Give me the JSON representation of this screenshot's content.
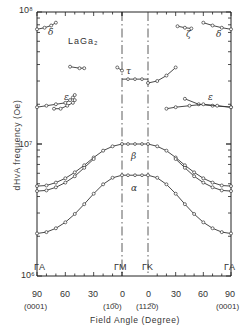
{
  "chart_data": {
    "type": "scatter",
    "xlabel": "Field Angle (Degree)",
    "ylabel": "dHvA frequency (Oe)",
    "yscale": "log",
    "ylim": [
      1000000,
      100000000
    ],
    "y_ticks": [
      "10^6",
      "10^7",
      "10^8"
    ],
    "x_segments": [
      {
        "from": "ΓA",
        "to": "ΓM",
        "from_deg": 90,
        "to_deg": 0,
        "from_dir": "(0001)",
        "to_dir": "(10-10)"
      },
      {
        "from": "ΓK",
        "to": "ΓA",
        "from_deg": 0,
        "to_deg": 90,
        "from_dir": "(11-20)",
        "to_dir": "(0001)"
      }
    ],
    "x_tick_labels": [
      "90",
      "60",
      "30",
      "0",
      "0",
      "30",
      "60",
      "90"
    ],
    "direction_labels": [
      "(0001)",
      "(10̅0)",
      "(112̅0)",
      "(0001)"
    ],
    "symmetry_labels": [
      "ΓA",
      "ΓM",
      "ΓK",
      "ΓA"
    ],
    "grid": false,
    "legend": "none",
    "series": [
      {
        "name": "α",
        "points": [
          [
            -90,
            2100000.0
          ],
          [
            -80,
            2150000.0
          ],
          [
            -70,
            2300000.0
          ],
          [
            -60,
            2550000.0
          ],
          [
            -50,
            2950000.0
          ],
          [
            -40,
            3500000.0
          ],
          [
            -30,
            4200000.0
          ],
          [
            -20,
            4950000.0
          ],
          [
            -10,
            5550000.0
          ],
          [
            0,
            5800000.0
          ],
          [
            0,
            5800000.0
          ],
          [
            10,
            5550000.0
          ],
          [
            20,
            4950000.0
          ],
          [
            30,
            4200000.0
          ],
          [
            40,
            3500000.0
          ],
          [
            50,
            2950000.0
          ],
          [
            60,
            2550000.0
          ],
          [
            70,
            2300000.0
          ],
          [
            80,
            2150000.0
          ],
          [
            90,
            2100000.0
          ]
        ],
        "flat_between_M_K": 5800000.0
      },
      {
        "name": "β",
        "points": [
          [
            -90,
            4800000.0
          ],
          [
            -80,
            4850000.0
          ],
          [
            -70,
            5100000.0
          ],
          [
            -60,
            5500000.0
          ],
          [
            -50,
            6100000.0
          ],
          [
            -40,
            6900000.0
          ],
          [
            -30,
            7900000.0
          ],
          [
            -20,
            8900000.0
          ],
          [
            -10,
            9600000.0
          ],
          [
            0,
            10000000.0
          ],
          [
            0,
            10000000.0
          ],
          [
            10,
            9600000.0
          ],
          [
            20,
            8900000.0
          ],
          [
            30,
            7900000.0
          ],
          [
            40,
            6900000.0
          ],
          [
            50,
            6100000.0
          ],
          [
            60,
            5500000.0
          ],
          [
            70,
            5100000.0
          ],
          [
            80,
            4850000.0
          ],
          [
            90,
            4800000.0
          ]
        ],
        "flat_between_M_K": 10000000.0
      },
      {
        "name": "β'",
        "points": [
          [
            -90,
            4400000.0
          ],
          [
            -80,
            4450000.0
          ],
          [
            -70,
            4700000.0
          ],
          [
            -60,
            5100000.0
          ],
          [
            -50,
            5700000.0
          ],
          [
            -40,
            6600000.0
          ],
          [
            -30,
            7700000.0
          ],
          [
            30,
            7700000.0
          ],
          [
            40,
            6600000.0
          ],
          [
            50,
            5700000.0
          ],
          [
            60,
            5100000.0
          ],
          [
            70,
            4700000.0
          ],
          [
            80,
            4450000.0
          ],
          [
            90,
            4400000.0
          ]
        ]
      },
      {
        "name": "τ",
        "points": [
          [
            -5,
            38000000.0
          ],
          [
            0,
            36000000.0
          ],
          [
            0,
            29000000.0
          ],
          [
            10,
            30000000.0
          ],
          [
            20,
            33000000.0
          ],
          [
            30,
            38000000.0
          ]
        ],
        "flat_between_M_K": 31000000.0
      },
      {
        "name": "τ (isolated)",
        "points": [
          [
            -55,
            38500000.0
          ],
          [
            -45,
            37500000.0
          ],
          [
            -40,
            37500000.0
          ]
        ]
      },
      {
        "name": "δ",
        "points": [
          [
            -90,
            74000000.0
          ],
          [
            -82,
            76000000.0
          ],
          [
            -75,
            79000000.0
          ],
          [
            -70,
            83000000.0
          ],
          [
            60,
            83000000.0
          ],
          [
            70,
            79000000.0
          ],
          [
            80,
            76000000.0
          ],
          [
            90,
            74000000.0
          ]
        ]
      },
      {
        "name": "ζ",
        "points": [
          [
            32,
            78000000.0
          ],
          [
            40,
            76000000.0
          ],
          [
            47,
            75000000.0
          ]
        ]
      },
      {
        "name": "ε",
        "points": [
          [
            -90,
            19000000.0
          ],
          [
            -80,
            19500000.0
          ],
          [
            -70,
            20000000.0
          ],
          [
            -60,
            20500000.0
          ],
          [
            -55,
            21500000.0
          ],
          [
            -52,
            22500000.0
          ],
          [
            -50,
            23500000.0
          ],
          [
            40,
            22000000.0
          ],
          [
            55,
            20000000.0
          ],
          [
            70,
            19500000.0
          ],
          [
            90,
            19000000.0
          ]
        ]
      },
      {
        "name": "ε'",
        "points": [
          [
            -72,
            18500000.0
          ],
          [
            -65,
            18500000.0
          ],
          [
            -58,
            19500000.0
          ],
          [
            -52,
            20500000.0
          ],
          [
            -50,
            21500000.0
          ],
          [
            20,
            18500000.0
          ],
          [
            30,
            19000000.0
          ],
          [
            45,
            19500000.0
          ],
          [
            60,
            20000000.0
          ],
          [
            75,
            19500000.0
          ],
          [
            90,
            19000000.0
          ]
        ]
      }
    ],
    "annotations": [
      "LaGa2",
      "α",
      "β",
      "τ",
      "δ",
      "ζ",
      "ε",
      "ε",
      "δ"
    ]
  },
  "labels": {
    "compound": "LaGa₂",
    "y_title": "dHvA frequency (Oe)",
    "x_title": "Field Angle (Degree)",
    "y_tick_top": "10⁸",
    "y_tick_mid": "10⁷",
    "y_tick_bot": "10⁶",
    "sym_GA_left": "ΓA",
    "sym_GM": "ΓM",
    "sym_GK": "ΓK",
    "sym_GA_right": "ΓA",
    "x90l": "90",
    "x60l": "60",
    "x30l": "30",
    "x0m": "0",
    "x0k": "0",
    "x30r": "30",
    "x60r": "60",
    "x90r": "90",
    "dir_left": "(0001)",
    "dir_M": "(10̅0)",
    "dir_K": "(112̅0)",
    "dir_right": "(0001)",
    "g_delta_l": "δ",
    "g_zeta": "ζ",
    "g_delta_r": "δ",
    "g_tau": "τ",
    "g_eps_l": "ε",
    "g_eps_r": "ε",
    "g_beta": "β",
    "g_alpha": "α"
  }
}
